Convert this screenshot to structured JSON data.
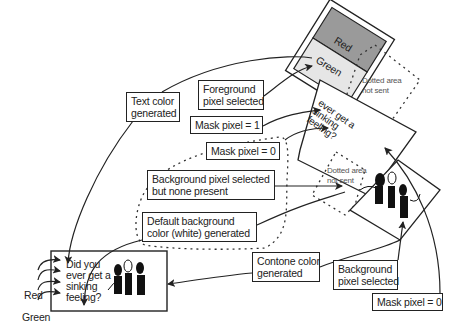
{
  "diagram": {
    "callouts": {
      "text_color": [
        "Text color",
        "generated"
      ],
      "foreground_pixel": [
        "Foreground",
        "pixel selected"
      ],
      "mask_one": "Mask pixel = 1",
      "mask_zero_mid": "Mask pixel = 0",
      "bg_none_present": [
        "Background pixel selected",
        "but none present"
      ],
      "default_bg": [
        "Default background",
        "color (white) generated"
      ],
      "contone_color": [
        "Contone color",
        "generated"
      ],
      "bg_pixel_selected": [
        "Background",
        "pixel selected"
      ],
      "mask_zero_bottom": "Mask pixel = 0"
    },
    "planes": {
      "top_bands": {
        "red": "Red",
        "green": "Green"
      },
      "dotted_top": [
        "Dotted area",
        "not sent"
      ],
      "dotted_mid": [
        "Dotted area",
        "not sent"
      ],
      "mask_text": [
        "ever get a",
        "sinking",
        "feeling?"
      ]
    },
    "output_document": {
      "text": [
        "Did you",
        "ever get a",
        "sinking",
        "feeling?"
      ],
      "legend_red": "Red",
      "legend_green": "Green"
    },
    "colors": {
      "line": "#222222",
      "red_band": "#9a9a9a",
      "green_band": "#e6e6e6",
      "dotted": "#333333"
    }
  }
}
